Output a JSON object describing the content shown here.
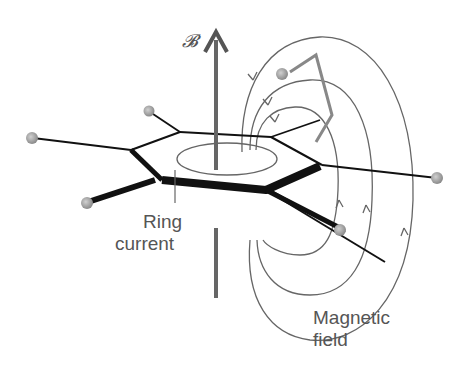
{
  "diagram": {
    "type": "physics-illustration",
    "labels": {
      "field_axis": "𝓑",
      "ring_current_line1": "Ring",
      "ring_current_line2": "current",
      "magnetic_field_line1": "Magnetic",
      "magnetic_field_line2": "field"
    },
    "colors": {
      "axis": "#666666",
      "bonds": "#111111",
      "field_lines": "#666666",
      "atoms": "#999999",
      "text": "#555555"
    }
  }
}
